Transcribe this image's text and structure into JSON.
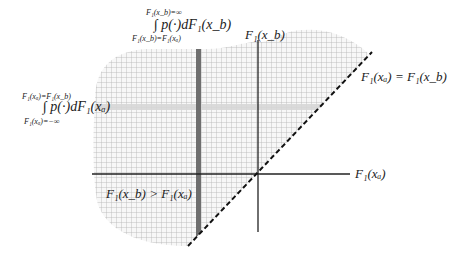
{
  "diagram": {
    "axes": {
      "x_label": "F₁(xₐ)",
      "y_label": "F₁(x_b)",
      "origin": [
        258,
        174
      ]
    },
    "diagonal_label": "F₁(xₐ) = F₁(x_b)",
    "region_label": "F₁(x_b) > F₁(xₐ)",
    "integral_top": {
      "upper_limit": "F₁(x_b)=∞",
      "integrand": "∫ p(·)dF₁(x_b)",
      "lower_limit": "F₁(x_b)=F₁(xₐ)"
    },
    "integral_left": {
      "upper_limit": "F₁(xₐ)=F₁(x_b)",
      "integrand": "∫ p(·)dF₁(xₐ)",
      "lower_limit": "F₁(xₐ)=−∞"
    },
    "colors": {
      "grid": "#b8b8b8",
      "dark_band": "#6e6e6e",
      "light_band": "#d9d9d9",
      "axis": "#222222",
      "diagonal": "#111111"
    }
  }
}
